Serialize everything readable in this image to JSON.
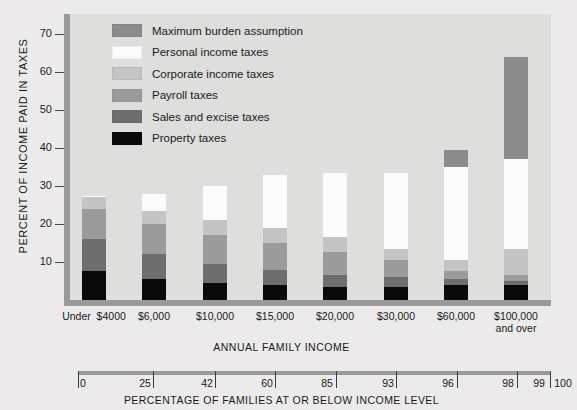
{
  "chart_data": {
    "type": "bar",
    "title": "",
    "subtype": "stacked-bar",
    "ylabel": "PERCENT OF INCOME PAID IN TAXES",
    "xlabel": "ANNUAL FAMILY INCOME",
    "ylim": [
      0,
      75
    ],
    "yticks": [
      10,
      20,
      30,
      40,
      50,
      60,
      70
    ],
    "ytick_labels": [
      "10",
      "20",
      "30",
      "40",
      "50",
      "60",
      "70"
    ],
    "grid": false,
    "legend_position": "upper-left-inside",
    "categories": [
      "Under $4000",
      "$6,000",
      "$10,000",
      "$15,000",
      "$20,000",
      "$30,000",
      "$60,000",
      "$100,000 and over"
    ],
    "category_lines": [
      [
        "Under",
        "$4000"
      ],
      [
        "$6,000"
      ],
      [
        "$10,000"
      ],
      [
        "$15,000"
      ],
      [
        "$20,000"
      ],
      [
        "$30,000"
      ],
      [
        "$60,000"
      ],
      [
        "$100,000",
        "and over"
      ]
    ],
    "series": [
      {
        "name": "Property taxes",
        "color": "#0a0a0a",
        "values": [
          7.5,
          5.5,
          4.5,
          4.0,
          3.5,
          3.5,
          4.0,
          4.0
        ]
      },
      {
        "name": "Sales and excise taxes",
        "color": "#6e6e6e",
        "values": [
          8.5,
          6.5,
          5.0,
          4.0,
          3.0,
          2.5,
          1.5,
          1.0
        ]
      },
      {
        "name": "Payroll taxes",
        "color": "#9b9b9b",
        "values": [
          8.0,
          8.0,
          7.5,
          7.0,
          6.0,
          4.5,
          2.0,
          1.5
        ]
      },
      {
        "name": "Corporate income taxes",
        "color": "#c4c4c4",
        "values": [
          3.0,
          3.5,
          4.0,
          4.0,
          4.0,
          3.0,
          3.0,
          7.0
        ]
      },
      {
        "name": "Personal income taxes",
        "color": "#fbfbfb",
        "values": [
          0.5,
          4.5,
          9.0,
          14.0,
          17.0,
          20.0,
          24.5,
          23.5
        ]
      },
      {
        "name": "Maximum burden assumption",
        "color": "#8c8c8c",
        "values": [
          0,
          0,
          0,
          0,
          0,
          0,
          4.5,
          27.0
        ]
      }
    ],
    "totals": [
      27.5,
      28.0,
      30.0,
      33.0,
      33.5,
      33.5,
      39.5,
      64.0
    ],
    "secondary_axis": {
      "title": "PERCENTAGE OF FAMILIES AT OR BELOW INCOME LEVEL",
      "ticks": [
        "0",
        "25",
        "42",
        "60",
        "85",
        "93",
        "96",
        "98",
        "99",
        "100"
      ]
    }
  },
  "legend": {
    "items": [
      {
        "label": "Maximum burden assumption",
        "color": "#8c8c8c"
      },
      {
        "label": "Personal income taxes",
        "color": "#fbfbfb"
      },
      {
        "label": "Corporate income taxes",
        "color": "#c4c4c4"
      },
      {
        "label": "Payroll taxes",
        "color": "#9b9b9b"
      },
      {
        "label": "Sales and excise taxes",
        "color": "#6e6e6e"
      },
      {
        "label": "Property taxes",
        "color": "#0a0a0a"
      }
    ]
  },
  "colors": {
    "page_background": "#eceaea",
    "plot_background": "#dededd",
    "axis": "#9a9a9a",
    "text": "#1a1a1a"
  }
}
